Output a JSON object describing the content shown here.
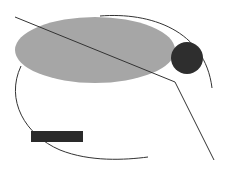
{
  "canvas": {
    "width": 225,
    "height": 174,
    "background": "#ffffff"
  },
  "shapes": {
    "ellipse": {
      "cx": 95,
      "cy": 50,
      "rx": 80,
      "ry": 33,
      "fill": "#a6a6a6"
    },
    "circle": {
      "cx": 187,
      "cy": 58,
      "r": 16,
      "fill": "#2e2e2e"
    },
    "line_upper": {
      "x1": 15,
      "y1": 17,
      "x2": 175,
      "y2": 82,
      "stroke": "#333333"
    },
    "line_lower": {
      "x1": 175,
      "y1": 82,
      "x2": 214,
      "y2": 160,
      "stroke": "#333333"
    },
    "arc_upper": {
      "stroke": "#333333"
    },
    "arc_lower": {
      "stroke": "#333333"
    }
  },
  "label": {
    "text": "",
    "fill": "#2a2a2a"
  }
}
